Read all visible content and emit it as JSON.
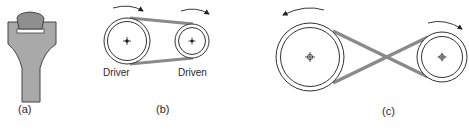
{
  "figure": {
    "panels": [
      {
        "id": "a",
        "caption": "(a)",
        "description": "V-belt cross-section in pulley groove"
      },
      {
        "id": "b",
        "caption": "(b)",
        "description": "Open belt drive",
        "pulley_labels": [
          "Driver",
          "Driven"
        ]
      },
      {
        "id": "c",
        "caption": "(c)",
        "description": "Crossed belt drive"
      }
    ]
  },
  "colors": {
    "belt": "#8a8a8a",
    "groove": "#a9a9a9",
    "belt_section": "#8f8f8f",
    "outline": "#333333"
  }
}
